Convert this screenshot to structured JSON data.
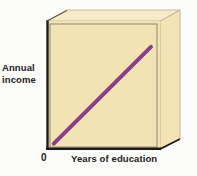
{
  "figure": {
    "background_color": "#fcfcfa"
  },
  "axes": {
    "y_label_line1": "Annual",
    "y_label_line2": "income",
    "x_label": "Years of education",
    "origin_label": "0"
  },
  "style": {
    "plot_face_color": "#f2e3b4",
    "top_bevel_color": "#f6eac6",
    "side_face_color": "#f3e4b6",
    "frame_line_color": "#7d7a66",
    "dark_edge_color": "#1c1a18",
    "line_color": "#8d3f86",
    "text_color": "#222021"
  },
  "chart_data": {
    "type": "line",
    "title": "",
    "xlabel": "Years of education",
    "ylabel": "Annual income",
    "grid": false,
    "legend": false,
    "xlim": [
      0,
      10
    ],
    "ylim": [
      0,
      10
    ],
    "xticks": [
      "0"
    ],
    "yticks": [],
    "annotations": [
      "Positive linear relationship between years of education and annual income"
    ],
    "series": [
      {
        "name": "Annual income vs. years of education",
        "color": "#8d3f86",
        "x": [
          0.6,
          9.2
        ],
        "y": [
          0.5,
          8.0
        ],
        "line_width": 4
      }
    ]
  }
}
